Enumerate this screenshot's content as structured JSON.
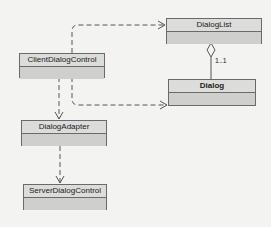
{
  "diagram": {
    "type": "uml-class-diagram",
    "classes": [
      {
        "id": "dialog_list",
        "name": "DialogList"
      },
      {
        "id": "client_dialog_control",
        "name": "ClientDialogControl"
      },
      {
        "id": "dialog",
        "name": "Dialog"
      },
      {
        "id": "dialog_adapter",
        "name": "DialogAdapter"
      },
      {
        "id": "server_dialog_control",
        "name": "ServerDialogControl"
      }
    ],
    "relations": [
      {
        "from": "ClientDialogControl",
        "to": "DialogList",
        "kind": "dependency"
      },
      {
        "from": "ClientDialogControl",
        "to": "Dialog",
        "kind": "dependency"
      },
      {
        "from": "ClientDialogControl",
        "to": "DialogAdapter",
        "kind": "dependency"
      },
      {
        "from": "DialogAdapter",
        "to": "ServerDialogControl",
        "kind": "dependency"
      },
      {
        "from": "DialogList",
        "to": "Dialog",
        "kind": "aggregation",
        "multiplicity": "1..1"
      }
    ],
    "labels": {
      "aggregation_multiplicity": "1..1"
    },
    "colors": {
      "background": "#f3f3f1",
      "box_fill": "#d3d3d1",
      "box_border": "#6a6a6a",
      "line": "#555555"
    }
  }
}
